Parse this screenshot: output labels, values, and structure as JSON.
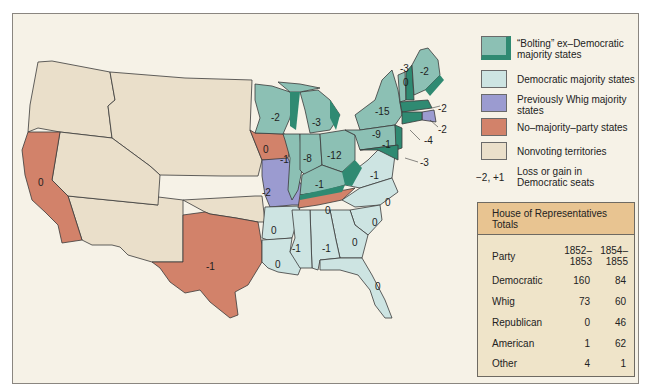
{
  "map": {
    "colors": {
      "bolting": "#8cc0b4",
      "bolting_edge": "#2f8a72",
      "democratic": "#cde4e2",
      "whig": "#9b9bd0",
      "no_majority": "#d2826a",
      "nonvoting": "#eadfca",
      "background": "#f6f2e7",
      "border": "#3a3a3a"
    },
    "state_labels": [
      {
        "state": "California",
        "value": "0"
      },
      {
        "state": "Texas",
        "value": "-1"
      },
      {
        "state": "Iowa",
        "value": "0"
      },
      {
        "state": "Missouri",
        "value": "-2"
      },
      {
        "state": "Wisconsin",
        "value": "-2"
      },
      {
        "state": "Michigan",
        "value": "-3"
      },
      {
        "state": "Illinois",
        "value": "-1"
      },
      {
        "state": "Indiana",
        "value": "-8"
      },
      {
        "state": "Ohio",
        "value": "-12"
      },
      {
        "state": "Kentucky",
        "value": "-1"
      },
      {
        "state": "Tennessee",
        "value": "0"
      },
      {
        "state": "Virginia",
        "value": "-1"
      },
      {
        "state": "North Carolina",
        "value": "0"
      },
      {
        "state": "South Carolina",
        "value": "0"
      },
      {
        "state": "Georgia",
        "value": "0"
      },
      {
        "state": "Alabama",
        "value": "-1"
      },
      {
        "state": "Mississippi",
        "value": "-1"
      },
      {
        "state": "Louisiana",
        "value": "0"
      },
      {
        "state": "Arkansas",
        "value": "0"
      },
      {
        "state": "Florida",
        "value": "0"
      },
      {
        "state": "New York",
        "value": "-15"
      },
      {
        "state": "Pennsylvania",
        "value": "-9"
      },
      {
        "state": "New Jersey",
        "value": "-1"
      },
      {
        "state": "Maine",
        "value": "-2"
      },
      {
        "state": "Vermont",
        "value": "-3"
      },
      {
        "state": "New Hampshire",
        "value": "0"
      },
      {
        "state": "Massachusetts",
        "value": "-2"
      },
      {
        "state": "Rhode Island",
        "value": "-2"
      },
      {
        "state": "Connecticut",
        "value": "-4"
      },
      {
        "state": "Maryland/Delaware",
        "value": "-3"
      }
    ]
  },
  "legend": {
    "items": [
      {
        "key": "bolting",
        "label": "“Bolting” ex–Democratic majority states"
      },
      {
        "key": "democratic",
        "label": "Democratic majority states"
      },
      {
        "key": "whig",
        "label": "Previously Whig majority states"
      },
      {
        "key": "no_majority",
        "label": "No–majority–party states"
      },
      {
        "key": "nonvoting",
        "label": "Nonvoting territories"
      }
    ],
    "note_key": "−2, +1",
    "note_label": "Loss or gain in Democratic seats"
  },
  "table": {
    "title": "House of Representatives Totals",
    "header": {
      "party": "Party",
      "col1": "1852– 1853",
      "col2": "1854– 1855"
    },
    "rows": [
      {
        "party": "Democratic",
        "c1": "160",
        "c2": "84"
      },
      {
        "party": "Whig",
        "c1": "73",
        "c2": "60"
      },
      {
        "party": "Republican",
        "c1": "0",
        "c2": "46"
      },
      {
        "party": "American",
        "c1": "1",
        "c2": "62"
      },
      {
        "party": "Other",
        "c1": "4",
        "c2": "1"
      }
    ]
  }
}
